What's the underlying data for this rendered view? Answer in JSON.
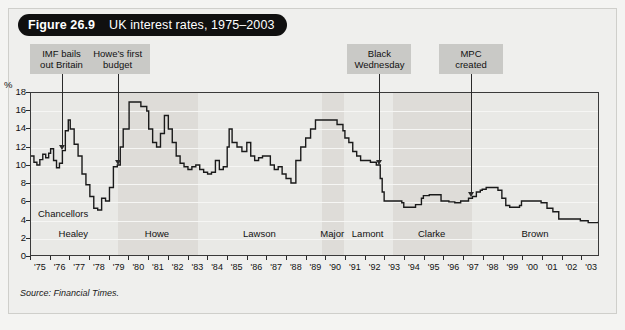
{
  "figure": {
    "number": "Figure 26.9",
    "title": "UK interest rates, 1975–2003",
    "source": "Source: Financial Times."
  },
  "annotations": [
    {
      "name": "imf-bails-out-britain",
      "line1": "IMF bails",
      "line2": "out Britain",
      "year": 1976.6
    },
    {
      "name": "howes-first-budget",
      "line1": "Howe’s first",
      "line2": "budget",
      "year": 1979.45
    },
    {
      "name": "black-wednesday",
      "line1": "Black",
      "line2": "Wednesday",
      "year": 1992.75
    },
    {
      "name": "mpc-created",
      "line1": "MPC",
      "line2": "created",
      "year": 1997.4
    }
  ],
  "chancellors": {
    "caption": "Chancellors",
    "items": [
      {
        "name": "Healey",
        "start": 1975.0,
        "end": 1979.4
      },
      {
        "name": "Howe",
        "start": 1979.4,
        "end": 1983.5
      },
      {
        "name": "Lawson",
        "start": 1983.5,
        "end": 1989.8
      },
      {
        "name": "Major",
        "start": 1989.8,
        "end": 1990.9
      },
      {
        "name": "Lamont",
        "start": 1990.9,
        "end": 1993.4
      },
      {
        "name": "Clarke",
        "start": 1993.4,
        "end": 1997.4
      },
      {
        "name": "Brown",
        "start": 1997.4,
        "end": 2003.9
      }
    ]
  },
  "chart_data": {
    "type": "line",
    "title": "UK interest rates, 1975–2003",
    "xlabel": "",
    "ylabel": "%",
    "ylim": [
      0,
      18
    ],
    "xlim": [
      1975,
      2003.9
    ],
    "yticks": [
      0,
      2,
      4,
      6,
      8,
      10,
      12,
      14,
      16,
      18
    ],
    "ytick_labels": [
      "0",
      "2",
      "4",
      "6",
      "8",
      "10",
      "12",
      "14",
      "16",
      "18"
    ],
    "xtick_labels": [
      "'75",
      "'76",
      "'77",
      "'78",
      "'79",
      "'80",
      "'81",
      "'82",
      "'83",
      "'84",
      "'85",
      "'86",
      "'87",
      "'88",
      "'89",
      "'90",
      "'91",
      "'92",
      "'93",
      "'94",
      "'95",
      "'96",
      "'97",
      "'98",
      "'99",
      "'00",
      "'01",
      "'02",
      "'03"
    ],
    "grid": true,
    "legend": "none",
    "line_color": "#1a1a1a",
    "series": [
      {
        "name": "UK interest rate",
        "x": [
          1975.0,
          1975.15,
          1975.3,
          1975.45,
          1975.6,
          1975.75,
          1975.9,
          1976.0,
          1976.15,
          1976.3,
          1976.45,
          1976.6,
          1976.75,
          1976.9,
          1977.0,
          1977.2,
          1977.4,
          1977.6,
          1977.8,
          1978.0,
          1978.2,
          1978.4,
          1978.6,
          1978.8,
          1979.0,
          1979.2,
          1979.4,
          1979.55,
          1979.7,
          1979.85,
          1980.0,
          1980.3,
          1980.6,
          1980.9,
          1981.0,
          1981.2,
          1981.4,
          1981.6,
          1981.8,
          1982.0,
          1982.2,
          1982.4,
          1982.6,
          1982.8,
          1983.0,
          1983.2,
          1983.4,
          1983.6,
          1983.8,
          1984.0,
          1984.2,
          1984.4,
          1984.6,
          1984.8,
          1985.0,
          1985.1,
          1985.25,
          1985.5,
          1985.75,
          1986.0,
          1986.2,
          1986.4,
          1986.6,
          1986.8,
          1987.0,
          1987.2,
          1987.4,
          1987.6,
          1987.8,
          1988.0,
          1988.25,
          1988.5,
          1988.75,
          1989.0,
          1989.25,
          1989.5,
          1989.75,
          1990.0,
          1990.3,
          1990.6,
          1990.9,
          1991.0,
          1991.2,
          1991.4,
          1991.6,
          1991.8,
          1992.0,
          1992.3,
          1992.6,
          1992.72,
          1992.8,
          1992.9,
          1993.0,
          1993.3,
          1993.6,
          1993.9,
          1994.0,
          1994.3,
          1994.6,
          1994.9,
          1995.0,
          1995.3,
          1995.6,
          1995.9,
          1996.0,
          1996.3,
          1996.6,
          1996.9,
          1997.0,
          1997.3,
          1997.5,
          1997.7,
          1997.9,
          1998.0,
          1998.2,
          1998.4,
          1998.6,
          1998.8,
          1999.0,
          1999.2,
          1999.4,
          1999.6,
          1999.9,
          2000.0,
          2000.3,
          2000.6,
          2000.9,
          2001.0,
          2001.3,
          2001.6,
          2001.9,
          2002.0,
          2002.4,
          2002.8,
          2003.0,
          2003.4,
          2003.9
        ],
        "y": [
          11.0,
          10.3,
          10.0,
          10.6,
          11.2,
          10.8,
          11.3,
          11.8,
          10.5,
          9.7,
          10.2,
          11.6,
          13.8,
          15.0,
          14.0,
          12.3,
          11.0,
          9.0,
          7.8,
          6.5,
          5.2,
          5.0,
          6.3,
          6.0,
          7.5,
          9.8,
          10.0,
          12.0,
          14.0,
          14.0,
          17.0,
          17.0,
          16.5,
          16.0,
          14.0,
          12.5,
          12.0,
          13.5,
          15.5,
          14.0,
          12.5,
          11.0,
          10.2,
          9.8,
          9.5,
          9.8,
          10.0,
          9.5,
          9.2,
          9.0,
          9.2,
          10.5,
          9.5,
          9.8,
          12.0,
          14.0,
          12.5,
          12.0,
          11.5,
          12.5,
          11.0,
          10.5,
          10.8,
          11.0,
          11.0,
          10.0,
          9.5,
          9.8,
          9.0,
          8.5,
          8.0,
          10.5,
          12.0,
          13.0,
          14.0,
          15.0,
          15.0,
          15.0,
          15.0,
          14.5,
          13.8,
          13.0,
          12.5,
          11.5,
          11.0,
          10.5,
          10.5,
          10.3,
          10.0,
          10.0,
          8.5,
          7.0,
          6.0,
          6.0,
          6.0,
          5.8,
          5.3,
          5.3,
          5.6,
          6.3,
          6.6,
          6.7,
          6.7,
          6.0,
          6.0,
          5.9,
          5.8,
          6.0,
          6.0,
          6.3,
          6.5,
          7.0,
          7.2,
          7.3,
          7.5,
          7.5,
          7.5,
          7.2,
          6.3,
          5.5,
          5.3,
          5.3,
          5.5,
          6.0,
          6.0,
          6.0,
          6.0,
          5.8,
          5.2,
          4.8,
          4.0,
          4.0,
          4.0,
          4.0,
          3.8,
          3.6,
          3.7
        ]
      }
    ]
  }
}
